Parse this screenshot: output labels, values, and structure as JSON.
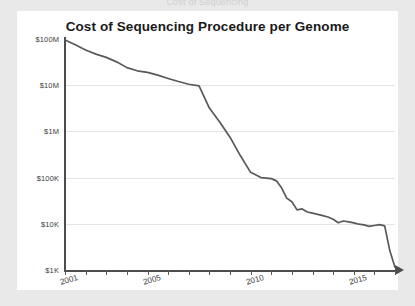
{
  "top_clip": {
    "text": "Cost of Sequencing"
  },
  "card": {
    "background": "#ffffff",
    "page_background": "#e9e9e9"
  },
  "chart_data": {
    "type": "line",
    "title": "Cost of Sequencing Procedure per Genome",
    "xlabel": "",
    "ylabel": "",
    "yscale": "log",
    "ylim": [
      1000,
      100000000
    ],
    "xlim": [
      2001,
      2017
    ],
    "grid": true,
    "legend": "none",
    "line_color": "#595959",
    "ytick_labels": [
      "$100M",
      "$10M",
      "$1M",
      "$100K",
      "$10K",
      "$1K"
    ],
    "ytick_values": [
      100000000,
      10000000,
      1000000,
      100000,
      10000,
      1000
    ],
    "xtick_labels": [
      "2001",
      "2005",
      "2010",
      "2015"
    ],
    "xtick_label_values": [
      2001,
      2005,
      2010,
      2015
    ],
    "xtick_values": [
      2001,
      2002,
      2003,
      2004,
      2005,
      2006,
      2007,
      2008,
      2009,
      2010,
      2011,
      2012,
      2013,
      2014,
      2015,
      2016,
      2017
    ],
    "x": [
      2001,
      2001.5,
      2002,
      2002.5,
      2003,
      2003.5,
      2004,
      2004.5,
      2005,
      2005.5,
      2006,
      2006.5,
      2007,
      2007.5,
      2008,
      2008.5,
      2009,
      2009.5,
      2010,
      2010.5,
      2011,
      2011.25,
      2011.5,
      2011.75,
      2012,
      2012.25,
      2012.5,
      2012.75,
      2013,
      2013.25,
      2013.5,
      2013.75,
      2014,
      2014.25,
      2014.5,
      2014.75,
      2015,
      2015.25,
      2015.5,
      2015.75,
      2016,
      2016.25,
      2016.5,
      2016.75,
      2017
    ],
    "values": [
      95000000,
      75000000,
      58000000,
      47000000,
      40000000,
      32000000,
      24000000,
      20500000,
      19000000,
      16500000,
      14000000,
      12000000,
      10500000,
      9700000,
      3200000,
      1600000,
      750000,
      300000,
      130000,
      100000,
      95000,
      85000,
      60000,
      36000,
      30000,
      20000,
      21000,
      18000,
      17000,
      16000,
      15000,
      14000,
      12500,
      10500,
      11500,
      11000,
      10500,
      9800,
      9500,
      8800,
      9200,
      9600,
      9000,
      2600,
      1150
    ],
    "series": [
      {
        "name": "Cost per genome",
        "values": [
          95000000,
          75000000,
          58000000,
          47000000,
          40000000,
          32000000,
          24000000,
          20500000,
          19000000,
          16500000,
          14000000,
          12000000,
          10500000,
          9700000,
          3200000,
          1600000,
          750000,
          300000,
          130000,
          100000,
          95000,
          85000,
          60000,
          36000,
          30000,
          20000,
          21000,
          18000,
          17000,
          16000,
          15000,
          14000,
          12500,
          10500,
          11500,
          11000,
          10500,
          9800,
          9500,
          8800,
          9200,
          9600,
          9000,
          2600,
          1150
        ]
      }
    ],
    "annotations": []
  }
}
